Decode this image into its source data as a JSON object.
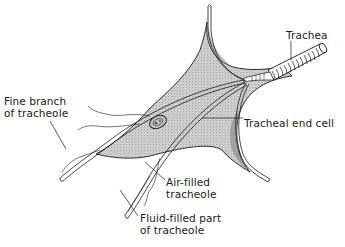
{
  "figure": {
    "type": "anatomical line drawing",
    "colors": {
      "ink": "#1a1a1a",
      "stipple": "#8a8a8a",
      "background": "#ffffff"
    }
  },
  "labels": {
    "trachea": "Trachea",
    "tracheal_end_cell": "Tracheal end cell",
    "fine_branch": [
      "Fine branch",
      "of tracheole"
    ],
    "air_filled": [
      "Air-filled",
      "tracheole"
    ],
    "fluid_filled": [
      "Fluid-filled part",
      "of tracheole"
    ]
  }
}
